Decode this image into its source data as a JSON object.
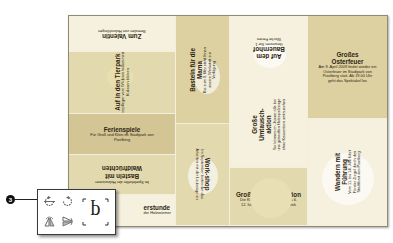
{
  "document": {
    "panels": [
      {
        "id": "valentin",
        "title": "Zum Valentin",
        "body": "Bemalen von Holzrohlingen",
        "orientation": "upside-down"
      },
      {
        "id": "tierpark",
        "title": "Auf in den Tierpark",
        "body": "Die Tierpfleger vom Wildpark lassen hinter die Kulissen blicken",
        "orientation": "rotated-left"
      },
      {
        "id": "ferienspiele",
        "title": "Ferienspiele",
        "body": "Für Groß und Klein im Stadtpark von Pixelberg",
        "orientation": "normal"
      },
      {
        "id": "waldfruechten",
        "title": "Basteln mit Waldfrüchten",
        "body": "Im Spielekeller der Holzwürmer",
        "orientation": "upside-down"
      },
      {
        "id": "bastelstunde",
        "title": "Bastelstunde",
        "body": "der Holzwürmer",
        "orientation": "normal",
        "visible_title": "erstunde",
        "visible_body": "der Holzwürmer"
      },
      {
        "id": "mama",
        "title": "Basteln für die Mama",
        "body": "Bis zum 9. Mai steht Ihnen unsere Werkstatt zur Verfügung",
        "orientation": "rotated-left"
      },
      {
        "id": "workshop",
        "title": "Work-shop",
        "body": "Im September bieten wir das Arbeiten mit der Laubsäge an",
        "orientation": "rotated-right"
      },
      {
        "id": "bauernhof",
        "title": "Auf dem Bauernhof",
        "body": "Gewinnen Sie 1 Woche Ferien",
        "orientation": "upside-down"
      },
      {
        "id": "umtausch",
        "title": "Große Umtausch-aktion",
        "body": "Sie können im Januar alle bei uns gekauften Holzspielzeuge ohne Kassenbon umtauschen",
        "orientation": "rotated-left"
      },
      {
        "id": "nikolaus",
        "title": "Große Nikolausaktion",
        "body": "Die Kleinen können vom 1. bis 6. 12. für die Lieben ein Geschenk basteln",
        "orientation": "normal"
      },
      {
        "id": "osterfeuer",
        "title": "Großes Osterfeuer",
        "body": "Am 9. April 2009 findet wieder ein Osterfeuer im Stadtpark von Pixelberg statt. Ab 19.00 Uhr geht das Spektakel los",
        "orientation": "normal"
      },
      {
        "id": "wandern",
        "title": "Wandern mit Führung",
        "body": "Vom 11. bis 14. Juni führt Förster Ziegel durch den Stadtforst von Pixelberg",
        "orientation": "rotated-left"
      }
    ]
  },
  "callout": {
    "number": "3"
  },
  "toolbox": {
    "tools": [
      {
        "name": "rotate-spread-counterclockwise",
        "icon": "rotate-ccw-icon"
      },
      {
        "name": "rotate-spread-clockwise",
        "icon": "rotate-cw-icon"
      },
      {
        "name": "flip-horizontal",
        "icon": "flip-horizontal-icon"
      },
      {
        "name": "flip-vertical",
        "icon": "flip-vertical-icon"
      },
      {
        "name": "reference-point-preview",
        "glyph": "p",
        "icon": "rotated-p-preview-icon"
      }
    ]
  },
  "colors": {
    "page": "#e4dcb4",
    "light": "#f5f1de",
    "mid": "#e3d9ae",
    "dark": "#d4c594",
    "text": "#2c2411"
  }
}
